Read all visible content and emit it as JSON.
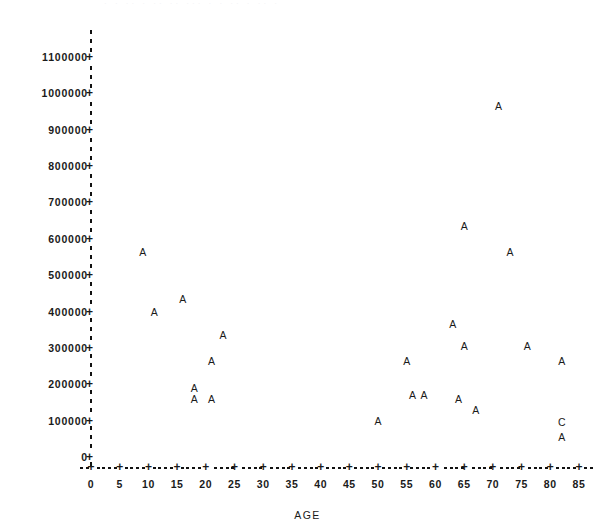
{
  "header": {
    "clipped_text": "  ·  ·   ·· · ··    ·· ···  ·  ·  ·· · ··  · "
  },
  "chart_data": {
    "type": "scatter",
    "title": "",
    "xlabel": "AGE",
    "ylabel": "PRICE",
    "xlim": [
      0,
      85
    ],
    "ylim": [
      0,
      1100000
    ],
    "grid": false,
    "legend_position": "none",
    "x_ticks": [
      0,
      5,
      10,
      15,
      20,
      25,
      30,
      35,
      40,
      45,
      50,
      55,
      60,
      65,
      70,
      75,
      80,
      85
    ],
    "x_tick_labels": [
      "0",
      "5",
      "10",
      "15",
      "20",
      "25",
      "30",
      "35",
      "40",
      "45",
      "50",
      "55",
      "60",
      "65",
      "70",
      "75",
      "80",
      "85"
    ],
    "y_ticks": [
      0,
      100000,
      200000,
      300000,
      400000,
      500000,
      600000,
      700000,
      800000,
      900000,
      1000000,
      1100000
    ],
    "y_tick_labels": [
      "0",
      "100000",
      "200000",
      "300000",
      "400000",
      "500000",
      "600000",
      "700000",
      "800000",
      "900000",
      "1000000",
      "1100000"
    ],
    "marker_style": "letter-frequency",
    "marker_legend": {
      "A": 1,
      "C": 3
    },
    "points": [
      {
        "x": 9,
        "y": 565000,
        "label": "A"
      },
      {
        "x": 11,
        "y": 400000,
        "label": "A"
      },
      {
        "x": 16,
        "y": 435000,
        "label": "A"
      },
      {
        "x": 18,
        "y": 190000,
        "label": "A"
      },
      {
        "x": 18,
        "y": 160000,
        "label": "A"
      },
      {
        "x": 21,
        "y": 160000,
        "label": "A"
      },
      {
        "x": 21,
        "y": 265000,
        "label": "A"
      },
      {
        "x": 23,
        "y": 335000,
        "label": "A"
      },
      {
        "x": 50,
        "y": 100000,
        "label": "A"
      },
      {
        "x": 55,
        "y": 265000,
        "label": "A"
      },
      {
        "x": 56,
        "y": 170000,
        "label": "A"
      },
      {
        "x": 58,
        "y": 170000,
        "label": "A"
      },
      {
        "x": 63,
        "y": 365000,
        "label": "A"
      },
      {
        "x": 64,
        "y": 160000,
        "label": "A"
      },
      {
        "x": 65,
        "y": 635000,
        "label": "A"
      },
      {
        "x": 65,
        "y": 305000,
        "label": "A"
      },
      {
        "x": 67,
        "y": 130000,
        "label": "A"
      },
      {
        "x": 71,
        "y": 965000,
        "label": "A"
      },
      {
        "x": 73,
        "y": 565000,
        "label": "A"
      },
      {
        "x": 76,
        "y": 305000,
        "label": "A"
      },
      {
        "x": 82,
        "y": 265000,
        "label": "A"
      },
      {
        "x": 82,
        "y": 95000,
        "label": "C"
      },
      {
        "x": 82,
        "y": 55000,
        "label": "A"
      }
    ]
  }
}
